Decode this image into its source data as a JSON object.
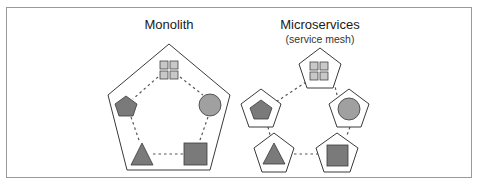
{
  "diagram": {
    "type": "architecture-comparison",
    "frame_color": "#9a9a9a",
    "stroke_color": "#3a3a3a",
    "fill_dark": "#7a7a7a",
    "fill_mid": "#a0a0a0",
    "fill_light": "#c8c8c8",
    "panels": [
      {
        "id": "monolith",
        "title": "Monolith",
        "subtitle": "",
        "components": [
          "grid",
          "circle",
          "square",
          "triangle",
          "pentagon"
        ],
        "container": "single-pentagon",
        "connections": "dashed-ring-inside"
      },
      {
        "id": "microservices",
        "title": "Microservices",
        "subtitle": "(service mesh)",
        "components": [
          "grid",
          "circle",
          "square",
          "triangle",
          "pentagon"
        ],
        "container": "pentagon-per-service",
        "connections": "dashed-links-between-services"
      }
    ]
  }
}
